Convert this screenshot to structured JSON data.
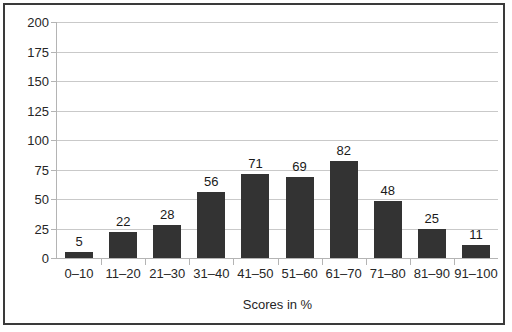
{
  "chart_data": {
    "type": "bar",
    "title": "",
    "xlabel": "Scores in %",
    "ylabel": "",
    "categories": [
      "0–10",
      "11–20",
      "21–30",
      "31–40",
      "41–50",
      "51–60",
      "61–70",
      "71–80",
      "81–90",
      "91–100"
    ],
    "values": [
      5,
      22,
      28,
      56,
      71,
      69,
      82,
      48,
      25,
      11
    ],
    "value_labels": [
      "5",
      "22",
      "28",
      "56",
      "71",
      "69",
      "82",
      "48",
      "25",
      "11"
    ],
    "ylim": [
      0,
      200
    ],
    "ytick_labels": [
      "0",
      "25",
      "50",
      "75",
      "100",
      "125",
      "150",
      "175",
      "200"
    ],
    "ytick_values": [
      0,
      25,
      50,
      75,
      100,
      125,
      150,
      175,
      200
    ],
    "grid": true,
    "legend": "none",
    "bar_color": "#333333",
    "gridline_color": "#c9c9c9",
    "axis_color": "#b4b4b4",
    "border_color": "#3a3a3a",
    "background_color": "#ffffff",
    "text_color": "#262626"
  }
}
